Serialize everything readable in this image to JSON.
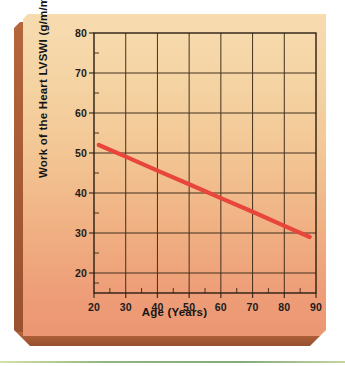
{
  "figure": {
    "panel_color_top": "#F7DCB0",
    "panel_color_bottom": "#EC9673",
    "bevel_color": "#9F5532",
    "line_color": "#E8453C",
    "grid_color": "#3A2A18",
    "axis_color": "#2A1E12"
  },
  "chart_data": {
    "type": "line",
    "title": "",
    "subtitle": "",
    "xlabel": "Age (Years)",
    "ylabel": "Work of the Heart LVSWI (g/m/m2)",
    "ylabel_unit_base": "Work of the Heart LVSWI (g/m/m",
    "ylabel_unit_exponent": "2",
    "ylabel_unit_close": ")",
    "xlim": [
      20,
      90
    ],
    "ylim": [
      15,
      80
    ],
    "xticks": [
      20,
      30,
      40,
      50,
      60,
      70,
      80,
      90
    ],
    "yticks": [
      20,
      30,
      40,
      50,
      60,
      70,
      80
    ],
    "xtick_labels": [
      "20",
      "30",
      "40",
      "50",
      "60",
      "70",
      "80",
      "90"
    ],
    "ytick_labels": [
      "20",
      "30",
      "40",
      "50",
      "60",
      "70",
      "80"
    ],
    "x_minor_ticks": [
      25,
      35,
      45,
      55,
      65,
      75,
      85
    ],
    "y_minor_ticks": [
      17.5,
      25,
      35,
      45,
      55,
      65,
      75
    ],
    "grid": true,
    "grid_x_values": [
      30,
      40,
      50,
      60,
      70,
      80
    ],
    "grid_y_values": [
      20,
      30,
      40,
      50,
      60,
      70
    ],
    "legend": null,
    "legend_position": "none",
    "series": [
      {
        "name": "Work of the Heart (LVSWI) regression",
        "color": "#E8453C",
        "x": [
          21.5,
          30,
          40,
          50,
          60,
          70,
          80,
          88
        ],
        "y": [
          52.0,
          49.1,
          45.6,
          42.2,
          38.7,
          35.3,
          31.8,
          29.0
        ]
      }
    ],
    "annotations": []
  },
  "axis_labels": {
    "y": [
      "80",
      "70",
      "60",
      "50",
      "40",
      "30",
      "20"
    ],
    "x": [
      "20",
      "30",
      "40",
      "50",
      "60",
      "70",
      "80",
      "90"
    ]
  }
}
